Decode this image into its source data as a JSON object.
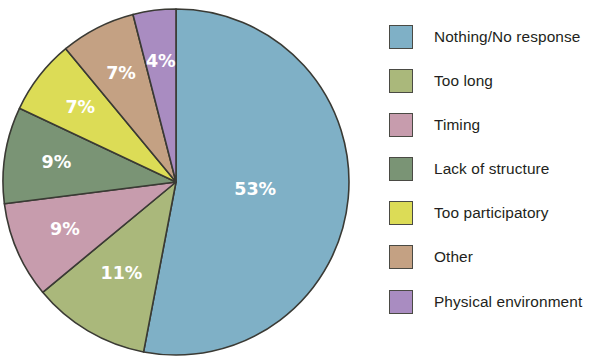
{
  "chart_data": {
    "type": "pie",
    "title": "",
    "subtitle": "",
    "xlabel": "",
    "ylabel": "",
    "legend_position": "right",
    "grid": false,
    "units": "percent",
    "total": 100,
    "start_angle_deg": 0,
    "direction": "clockwise",
    "categories": [
      "Nothing/No response",
      "Too long",
      "Timing",
      "Lack of structure",
      "Too participatory",
      "Other",
      "Physical environment"
    ],
    "values": [
      53,
      11,
      9,
      9,
      7,
      7,
      4
    ],
    "data_labels": [
      "53%",
      "11%",
      "9%",
      "9%",
      "7%",
      "7%",
      "4%"
    ],
    "colors": [
      "#7fb0c6",
      "#aab87b",
      "#c79cad",
      "#7a9475",
      "#dcdc56",
      "#c4a183",
      "#a98cc1"
    ],
    "slices": [
      {
        "label": "Nothing/No response",
        "value": 53,
        "data_label": "53%",
        "color": "#7fb0c6"
      },
      {
        "label": "Too long",
        "value": 11,
        "data_label": "11%",
        "color": "#aab87b"
      },
      {
        "label": "Timing",
        "value": 9,
        "data_label": "9%",
        "color": "#c79cad"
      },
      {
        "label": "Lack of structure",
        "value": 9,
        "data_label": "9%",
        "color": "#7a9475"
      },
      {
        "label": "Too participatory",
        "value": 7,
        "data_label": "7%",
        "color": "#dcdc56"
      },
      {
        "label": "Other",
        "value": 7,
        "data_label": "7%",
        "color": "#c4a183"
      },
      {
        "label": "Physical environment",
        "value": 4,
        "data_label": "4%",
        "color": "#a98cc1"
      }
    ]
  },
  "legend": {
    "items": [
      {
        "label": "Nothing/No response",
        "color": "#7fb0c6"
      },
      {
        "label": "Too long",
        "color": "#aab87b"
      },
      {
        "label": "Timing",
        "color": "#c79cad"
      },
      {
        "label": "Lack of structure",
        "color": "#7a9475"
      },
      {
        "label": "Too participatory",
        "color": "#dcdc56"
      },
      {
        "label": "Other",
        "color": "#c4a183"
      },
      {
        "label": "Physical environment",
        "color": "#a98cc1"
      }
    ]
  },
  "geometry": {
    "center_x": 176,
    "center_y": 182,
    "radius": 173
  }
}
